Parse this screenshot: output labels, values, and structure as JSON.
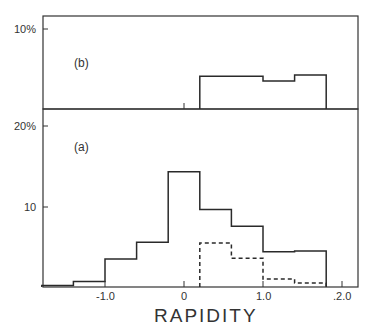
{
  "chart_data": [
    {
      "panel": "(b)",
      "type": "bar",
      "style": "step-histogram",
      "xlabel": "RAPIDITY",
      "ylabel": "",
      "y_tick_labels": [
        "10%"
      ],
      "ylim": [
        0,
        13.5
      ],
      "xlim": [
        -1.78,
        2.2
      ],
      "bin_edges": [
        0.2,
        1.0,
        1.4,
        1.8
      ],
      "series": [
        {
          "name": "solid",
          "line": "solid",
          "values": [
            4.1,
            3.5,
            4.25
          ]
        }
      ],
      "markers": [
        {
          "x": 0,
          "type": "tick"
        }
      ]
    },
    {
      "panel": "(a)",
      "type": "bar",
      "style": "step-histogram",
      "xlabel": "RAPIDITY",
      "ylabel": "",
      "x_tick_labels": [
        "-1.0",
        "0",
        "1.0",
        "2.0"
      ],
      "x_ticks": [
        -1.0,
        0,
        1.0,
        2.0
      ],
      "y_tick_labels": [
        "10",
        "20%"
      ],
      "y_ticks": [
        10,
        20
      ],
      "ylim": [
        0,
        20.5
      ],
      "xlim": [
        -1.78,
        2.2
      ],
      "bin_edges": [
        -1.8,
        -1.4,
        -1.0,
        -0.6,
        -0.2,
        0.2,
        0.6,
        1.0,
        1.4,
        1.8
      ],
      "series": [
        {
          "name": "solid",
          "line": "solid",
          "values": [
            0.2,
            0.7,
            3.5,
            5.6,
            14.4,
            9.7,
            7.6,
            4.4,
            4.5
          ]
        },
        {
          "name": "dashed",
          "line": "dashed",
          "bin_edges": [
            0.2,
            0.6,
            1.0,
            1.4,
            1.8
          ],
          "values": [
            5.5,
            3.6,
            1.0,
            0.5
          ]
        }
      ]
    }
  ],
  "labels": {
    "panel_b": "(b)",
    "panel_a": "(a)",
    "b_ytick": "10%",
    "a_ytick_top": "20%",
    "a_ytick_mid": "10",
    "x_ticks": [
      "-1.0",
      "0",
      "1.0",
      ".2.0"
    ],
    "xlabel": "RAPIDITY"
  }
}
